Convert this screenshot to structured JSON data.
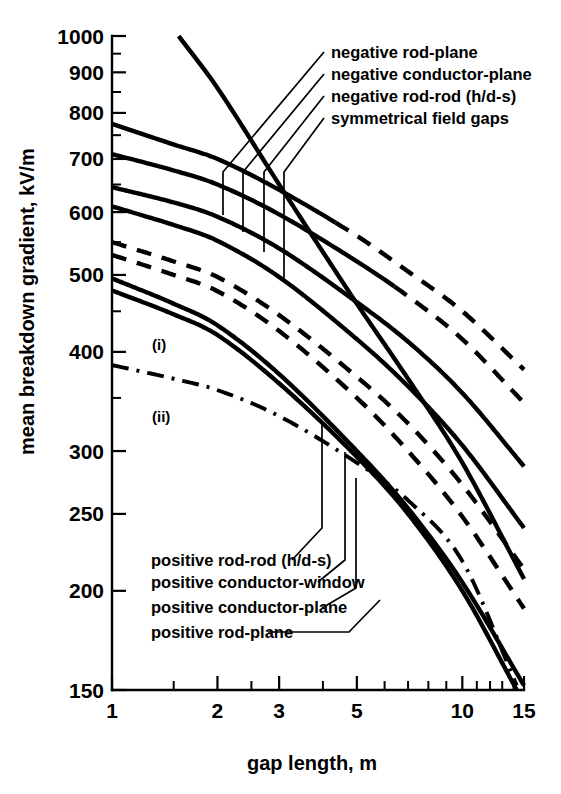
{
  "chart_data": {
    "type": "line",
    "title": "",
    "xlabel": "gap length, m",
    "ylabel": "mean breakdown gradient, kV/m",
    "xscale": "log",
    "yscale": "log",
    "xlim": [
      1,
      15
    ],
    "ylim": [
      150,
      1000
    ],
    "grid": false,
    "legend_position": "inline-annotations",
    "xticks": [
      1,
      2,
      3,
      5,
      10,
      15
    ],
    "xticklabels": [
      "1",
      "2",
      "3",
      "5",
      "10",
      "15"
    ],
    "xminorticks": [
      1.5,
      2.5,
      4,
      6,
      7,
      8,
      9,
      11,
      12,
      13,
      14
    ],
    "yticks": [
      150,
      200,
      250,
      300,
      400,
      500,
      600,
      700,
      800,
      900,
      1000
    ],
    "yticklabels": [
      "150",
      "200",
      "250",
      "300",
      "400",
      "500",
      "600",
      "700",
      "800",
      "900",
      "1000"
    ],
    "yminorticks": [
      350,
      450,
      550,
      650,
      750,
      850,
      950
    ],
    "series": [
      {
        "name": "symmetrical field gaps",
        "style": "solid",
        "x": [
          1.55,
          2,
          3,
          5,
          7,
          10,
          15
        ],
        "y": [
          1000,
          860,
          650,
          460,
          370,
          290,
          207
        ]
      },
      {
        "name": "negative rod-plane",
        "style": "solid-then-dashed",
        "dash_from_x": 4.35,
        "x": [
          1,
          1.5,
          2,
          3,
          5,
          7,
          10,
          15
        ],
        "y": [
          775,
          730,
          700,
          640,
          560,
          505,
          450,
          380
        ]
      },
      {
        "name": "negative conductor-plane",
        "style": "solid-then-dashed",
        "dash_from_x": 6.4,
        "x": [
          1,
          1.5,
          2,
          3,
          5,
          7,
          10,
          15
        ],
        "y": [
          710,
          677,
          650,
          596,
          520,
          470,
          415,
          345
        ]
      },
      {
        "name": "negative rod-rod (h/d-s)",
        "style": "solid",
        "x": [
          1,
          1.5,
          2,
          3,
          5,
          7,
          10,
          15
        ],
        "y": [
          645,
          617,
          592,
          540,
          462,
          412,
          355,
          287
        ]
      },
      {
        "name": "positive rod-rod (h/d-s)",
        "style": "solid",
        "x": [
          1,
          1.5,
          2,
          3,
          5,
          7,
          10,
          15
        ],
        "y": [
          610,
          578,
          552,
          497,
          415,
          362,
          305,
          240
        ]
      },
      {
        "name": "positive conductor-window",
        "style": "dashed",
        "x": [
          1,
          1.5,
          2,
          3,
          5,
          7,
          10,
          15
        ],
        "y": [
          550,
          520,
          497,
          445,
          372,
          325,
          272,
          213
        ]
      },
      {
        "name": "positive conductor-plane",
        "style": "dashed",
        "label": "(i)",
        "x": [
          1,
          1.5,
          2,
          3,
          5,
          7,
          10,
          15
        ],
        "y": [
          530,
          500,
          477,
          425,
          350,
          300,
          248,
          190
        ]
      },
      {
        "name": "positive rod-plane",
        "style": "solid",
        "x": [
          1,
          1.5,
          2,
          3,
          5,
          7,
          10,
          15
        ],
        "y": [
          495,
          460,
          432,
          375,
          300,
          254,
          205,
          152
        ]
      },
      {
        "name": "positive rod-plane-lower",
        "style": "solid",
        "x": [
          1,
          1.5,
          2,
          3,
          5,
          7,
          10,
          14.3
        ],
        "y": [
          478,
          446,
          420,
          365,
          295,
          250,
          200,
          150
        ]
      },
      {
        "name": "curve-ii",
        "style": "dash-dot",
        "label": "(ii)",
        "x": [
          1,
          1.5,
          2,
          3,
          5,
          7,
          10,
          14.3
        ],
        "y": [
          385,
          370,
          358,
          332,
          290,
          260,
          218,
          152
        ]
      }
    ],
    "annotations_upper": [
      "negative rod-plane",
      "negative conductor-plane",
      "negative rod-rod (h/d-s)",
      "symmetrical field gaps"
    ],
    "annotations_lower": [
      "positive rod-rod (h/d-s)",
      "positive conductor-window",
      "positive conductor-plane",
      "positive rod-plane"
    ],
    "inline_labels": [
      "(i)",
      "(ii)"
    ]
  }
}
